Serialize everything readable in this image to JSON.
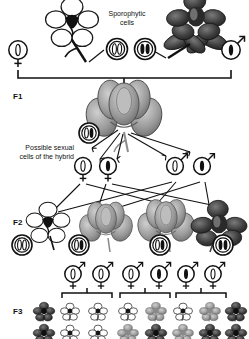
{
  "figure": {
    "type": "genetics-inheritance-diagram",
    "title_visible": false,
    "labels": {
      "sporophytic_cells": "Sporophytic\ncells",
      "sporophytic_cells_line1": "Sporophytic",
      "sporophytic_cells_line2": "cells",
      "possible_sexual_line1": "Possible sexual",
      "possible_sexual_line2": "cells of the hybrid",
      "f1": "F1",
      "f2": "F2",
      "f3": "F3"
    },
    "colors": {
      "ink": "#111111",
      "paper": "#ffffff",
      "allele_dominant": "#1a1a1a",
      "allele_recessive": "#ffffff",
      "flower_dark": "#3a3a3a",
      "flower_mid": "#8d8d8d",
      "flower_light": "#d8d8d8"
    },
    "generations": {
      "parental": {
        "left_parent": {
          "phenotype": "white-flower",
          "shade": "light"
        },
        "right_parent": {
          "phenotype": "dark-flower",
          "shade": "dark"
        },
        "left_gamete": {
          "sex": "female",
          "alleles": [
            "recessive"
          ]
        },
        "right_gamete": {
          "sex": "male",
          "alleles": [
            "dominant"
          ]
        },
        "sporophytic_cells": [
          {
            "alleles": [
              "recessive",
              "recessive"
            ]
          },
          {
            "alleles": [
              "dominant",
              "dominant"
            ]
          }
        ]
      },
      "f1": {
        "label": "F1",
        "flower": {
          "phenotype": "intermediate-flower",
          "shade": "mid"
        },
        "zygote_cell": {
          "alleles": [
            "recessive",
            "dominant"
          ]
        },
        "gametes": [
          {
            "sex": "female",
            "alleles": [
              "recessive"
            ]
          },
          {
            "sex": "female",
            "alleles": [
              "dominant"
            ]
          },
          {
            "sex": "male",
            "alleles": [
              "recessive"
            ]
          },
          {
            "sex": "male",
            "alleles": [
              "dominant"
            ]
          }
        ]
      },
      "f2": {
        "label": "F2",
        "offspring": [
          {
            "flower_shade": "white",
            "cell": {
              "alleles": [
                "recessive",
                "recessive"
              ]
            }
          },
          {
            "flower_shade": "mid",
            "cell": {
              "alleles": [
                "recessive",
                "dominant"
              ]
            }
          },
          {
            "flower_shade": "mid",
            "cell": {
              "alleles": [
                "recessive",
                "dominant"
              ]
            }
          },
          {
            "flower_shade": "dark",
            "cell": {
              "alleles": [
                "dominant",
                "dominant"
              ]
            }
          }
        ]
      },
      "f3": {
        "label": "F3",
        "groups": [
          {
            "gametes": [
              {
                "sex": "both",
                "alleles": [
                  "recessive"
                ]
              },
              {
                "sex": "both",
                "alleles": [
                  "recessive"
                ]
              }
            ],
            "offspring_shades": [
              "white",
              "white",
              "white",
              "white"
            ]
          },
          {
            "gametes": [
              {
                "sex": "both",
                "alleles": [
                  "recessive"
                ]
              },
              {
                "sex": "both",
                "alleles": [
                  "dominant"
                ]
              }
            ],
            "offspring_shades": [
              "white",
              "mid",
              "mid",
              "dark"
            ]
          },
          {
            "gametes": [
              {
                "sex": "both",
                "alleles": [
                  "recessive"
                ]
              },
              {
                "sex": "both",
                "alleles": [
                  "dominant"
                ]
              }
            ],
            "offspring_shades": [
              "white",
              "mid",
              "mid",
              "dark"
            ]
          },
          {
            "gametes": [
              {
                "sex": "both",
                "alleles": [
                  "dominant"
                ]
              },
              {
                "sex": "both",
                "alleles": [
                  "dominant"
                ]
              }
            ],
            "offspring_shades": [
              "dark",
              "dark",
              "dark",
              "dark"
            ]
          }
        ]
      }
    }
  }
}
